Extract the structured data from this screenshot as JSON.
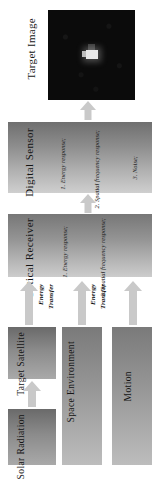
{
  "figure": {
    "orientation": "rotated-90-ccw",
    "caption": "Target Image",
    "palette": {
      "box_dark": "#6f6f6f",
      "box_light": "#cfcfcf",
      "arrow": "#c9c9c9",
      "image_background": "#0a0a0a",
      "image_target_spot": "#e8e8e8",
      "text": "#151515"
    }
  },
  "target_image": {
    "label": "Target Image",
    "description": "black frame with small bright target spot near center"
  },
  "stages": {
    "digital_sensor": {
      "title": "Digital Sensor",
      "items": [
        "1. Energy response;",
        "2. Spatial frequency response;",
        "3. Noise;"
      ]
    },
    "optical_receiver": {
      "title": "Optical Receiver",
      "items": [
        "1. Energy response;",
        "2. Spatial frequency response;"
      ]
    },
    "target_satellite": {
      "title": "Target Satellite"
    },
    "solar_radiation": {
      "title": "Solar Radiation"
    },
    "space_environment": {
      "title": "Space Environment"
    },
    "motion": {
      "title": "Motion"
    }
  },
  "arrows": {
    "energy_transfer_1": {
      "line1": "Energy",
      "line2": "Transfer"
    },
    "energy_transfer_2": {
      "line1": "Energy",
      "line2": "Transfer"
    },
    "motion_arrow": {
      "line1": "",
      "line2": ""
    },
    "solar_to_satellite": {
      "label": ""
    },
    "receiver_to_sensor": {
      "label": ""
    },
    "sensor_to_image": {
      "label": ""
    }
  }
}
